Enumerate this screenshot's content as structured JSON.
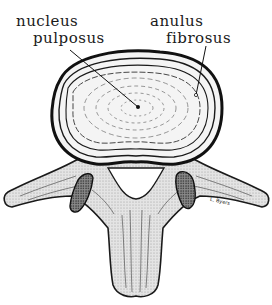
{
  "figure": {
    "labels": {
      "nucleus": {
        "line1": "nucleus",
        "line2": "pulposus"
      },
      "anulus": {
        "line1": "anulus",
        "line2": "fibrosus"
      }
    },
    "signature": "L. Byers",
    "colors": {
      "ink": "#1a1a1a",
      "background": "#ffffff",
      "bone_fill": "#d9d9d9",
      "disc_fill": "#f6f6f6"
    }
  }
}
